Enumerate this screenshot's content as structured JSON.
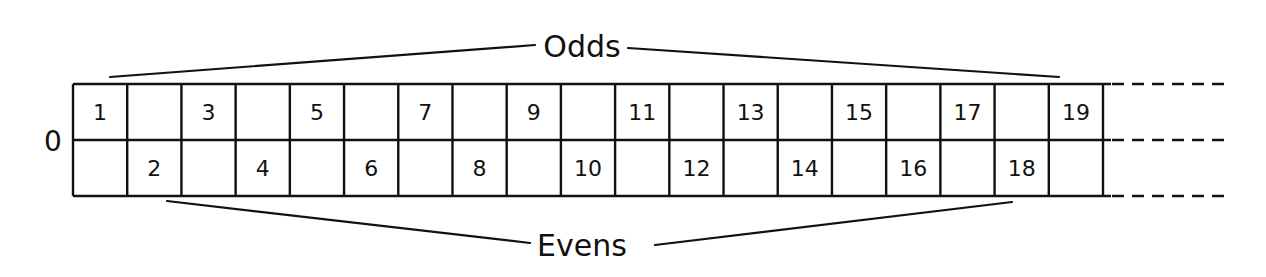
{
  "diagram": {
    "type": "number-strip",
    "row_label": "0",
    "top_bracket_label": "Odds",
    "bottom_bracket_label": "Evens",
    "columns": 19,
    "top_row": [
      "1",
      "",
      "3",
      "",
      "5",
      "",
      "7",
      "",
      "9",
      "",
      "11",
      "",
      "13",
      "",
      "15",
      "",
      "17",
      "",
      "19"
    ],
    "bottom_row": [
      "",
      "2",
      "",
      "4",
      "",
      "6",
      "",
      "8",
      "",
      "10",
      "",
      "12",
      "",
      "14",
      "",
      "16",
      "",
      "18",
      ""
    ],
    "continuation": "dashed-lines-right",
    "colors": {
      "ink": "#111111",
      "background": "#ffffff"
    }
  }
}
